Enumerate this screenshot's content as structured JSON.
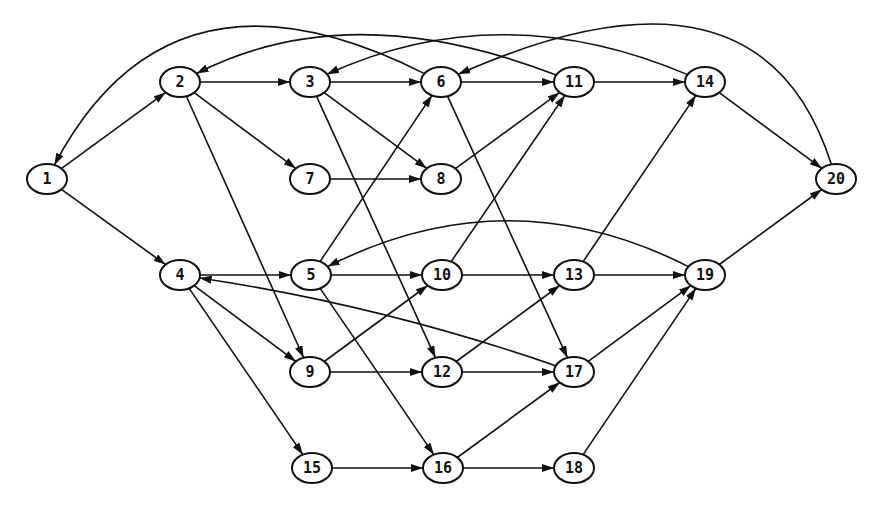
{
  "diagram": {
    "type": "directed-graph",
    "colors": {
      "stroke": "#111111",
      "node_fill": "#ffffff",
      "background": "#ffffff"
    },
    "nodes": [
      {
        "id": "1",
        "label": "1",
        "x": 47,
        "y": 179
      },
      {
        "id": "2",
        "label": "2",
        "x": 180,
        "y": 82
      },
      {
        "id": "3",
        "label": "3",
        "x": 310,
        "y": 82
      },
      {
        "id": "6",
        "label": "6",
        "x": 441,
        "y": 82
      },
      {
        "id": "11",
        "label": "11",
        "x": 574,
        "y": 82
      },
      {
        "id": "14",
        "label": "14",
        "x": 705,
        "y": 82
      },
      {
        "id": "7",
        "label": "7",
        "x": 310,
        "y": 179
      },
      {
        "id": "8",
        "label": "8",
        "x": 441,
        "y": 179
      },
      {
        "id": "20",
        "label": "20",
        "x": 836,
        "y": 179
      },
      {
        "id": "4",
        "label": "4",
        "x": 180,
        "y": 275
      },
      {
        "id": "5",
        "label": "5",
        "x": 311,
        "y": 275
      },
      {
        "id": "10",
        "label": "10",
        "x": 442,
        "y": 275
      },
      {
        "id": "13",
        "label": "13",
        "x": 574,
        "y": 275
      },
      {
        "id": "19",
        "label": "19",
        "x": 705,
        "y": 275
      },
      {
        "id": "9",
        "label": "9",
        "x": 310,
        "y": 372
      },
      {
        "id": "12",
        "label": "12",
        "x": 442,
        "y": 372
      },
      {
        "id": "17",
        "label": "17",
        "x": 574,
        "y": 372
      },
      {
        "id": "15",
        "label": "15",
        "x": 312,
        "y": 468
      },
      {
        "id": "16",
        "label": "16",
        "x": 443,
        "y": 468
      },
      {
        "id": "18",
        "label": "18",
        "x": 574,
        "y": 468
      }
    ],
    "edges": [
      {
        "from": "1",
        "to": "2"
      },
      {
        "from": "1",
        "to": "4"
      },
      {
        "from": "2",
        "to": "3"
      },
      {
        "from": "2",
        "to": "7"
      },
      {
        "from": "2",
        "to": "9"
      },
      {
        "from": "3",
        "to": "6"
      },
      {
        "from": "3",
        "to": "8"
      },
      {
        "from": "3",
        "to": "12"
      },
      {
        "from": "7",
        "to": "8"
      },
      {
        "from": "6",
        "to": "11"
      },
      {
        "from": "6",
        "to": "17"
      },
      {
        "from": "8",
        "to": "11"
      },
      {
        "from": "11",
        "to": "14"
      },
      {
        "from": "14",
        "to": "20"
      },
      {
        "from": "4",
        "to": "5"
      },
      {
        "from": "4",
        "to": "9"
      },
      {
        "from": "4",
        "to": "15"
      },
      {
        "from": "5",
        "to": "6"
      },
      {
        "from": "5",
        "to": "10"
      },
      {
        "from": "5",
        "to": "16"
      },
      {
        "from": "9",
        "to": "10"
      },
      {
        "from": "9",
        "to": "12"
      },
      {
        "from": "10",
        "to": "11"
      },
      {
        "from": "10",
        "to": "13"
      },
      {
        "from": "12",
        "to": "13"
      },
      {
        "from": "12",
        "to": "17"
      },
      {
        "from": "13",
        "to": "14"
      },
      {
        "from": "13",
        "to": "19"
      },
      {
        "from": "15",
        "to": "16"
      },
      {
        "from": "16",
        "to": "17"
      },
      {
        "from": "16",
        "to": "18"
      },
      {
        "from": "17",
        "to": "19"
      },
      {
        "from": "18",
        "to": "19"
      },
      {
        "from": "19",
        "to": "20"
      },
      {
        "from": "17",
        "to": "4",
        "curve": {
          "cx": 380,
          "cy": 305
        }
      },
      {
        "from": "19",
        "to": "5",
        "curve": {
          "cx": 508,
          "cy": 175
        }
      },
      {
        "from": "6",
        "to": "1",
        "curve": {
          "cx": 170,
          "cy": -55
        }
      },
      {
        "from": "11",
        "to": "2",
        "curve": {
          "cx": 350,
          "cy": -5
        }
      },
      {
        "from": "14",
        "to": "3",
        "curve": {
          "cx": 500,
          "cy": -5
        }
      },
      {
        "from": "20",
        "to": "6",
        "curve": {
          "cx": 760,
          "cy": -60
        }
      }
    ]
  }
}
